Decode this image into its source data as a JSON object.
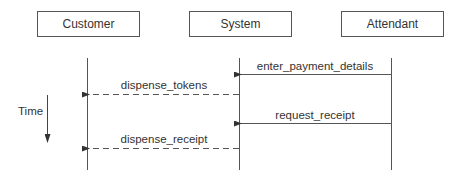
{
  "diagram": {
    "type": "sequence",
    "actors": [
      {
        "label": "Customer",
        "x": 87
      },
      {
        "label": "System",
        "x": 239
      },
      {
        "label": "Attendant",
        "x": 391
      }
    ],
    "messages": [
      {
        "label": "enter_payment_details",
        "from": "Attendant",
        "to": "System",
        "style": "solid",
        "y": 74
      },
      {
        "label": "dispense_tokens",
        "from": "System",
        "to": "Customer",
        "style": "dashed",
        "y": 94
      },
      {
        "label": "request_receipt",
        "from": "Attendant",
        "to": "System",
        "style": "solid",
        "y": 123
      },
      {
        "label": "dispense_receipt",
        "from": "System",
        "to": "Customer",
        "style": "dashed",
        "y": 148
      }
    ],
    "time_axis": {
      "label": "Time",
      "direction": "down"
    },
    "colors": {
      "line": "#555555",
      "text": "#333333",
      "background": "#ffffff"
    }
  }
}
